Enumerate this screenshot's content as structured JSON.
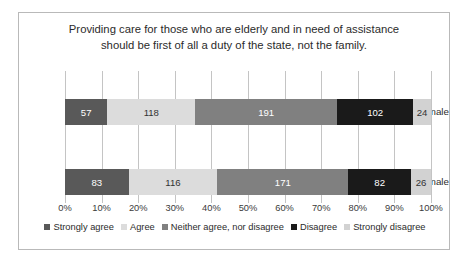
{
  "chart_data": {
    "type": "bar",
    "subtype": "stacked-horizontal-100pct",
    "title": "Providing care for those who are elderly and in need of assistance should be first of all a duty of the state, not the family.",
    "title_lines": [
      "Providing care for those who are elderly and in need of assistance",
      "should be first of all a duty of the state, not the family."
    ],
    "xlabel": "",
    "ylabel": "",
    "categories": [
      "female",
      "male"
    ],
    "series": [
      {
        "name": "Strongly agree",
        "color": "#595959",
        "label_color": "#ffffff",
        "values": [
          57,
          83
        ]
      },
      {
        "name": "Agree",
        "color": "#dcdcdc",
        "label_color": "#333333",
        "values": [
          118,
          116
        ]
      },
      {
        "name": "Neither agree, nor disagree",
        "color": "#808080",
        "label_color": "#ffffff",
        "values": [
          191,
          171
        ]
      },
      {
        "name": "Disagree",
        "color": "#1a1a1a",
        "label_color": "#ffffff",
        "values": [
          102,
          82
        ]
      },
      {
        "name": "Strongly disagree",
        "color": "#d2d2d2",
        "label_color": "#333333",
        "values": [
          24,
          26
        ]
      }
    ],
    "row_totals": [
      492,
      478
    ],
    "xticks": [
      "0%",
      "10%",
      "20%",
      "30%",
      "40%",
      "50%",
      "60%",
      "70%",
      "80%",
      "90%",
      "100%"
    ],
    "xlim": [
      0,
      100
    ],
    "grid": true,
    "legend_position": "bottom"
  },
  "colors": {
    "frame_border": "#b9b9b9",
    "gridline": "#c4c4c4",
    "background": "#ffffff",
    "text": "#2b2b2b"
  }
}
